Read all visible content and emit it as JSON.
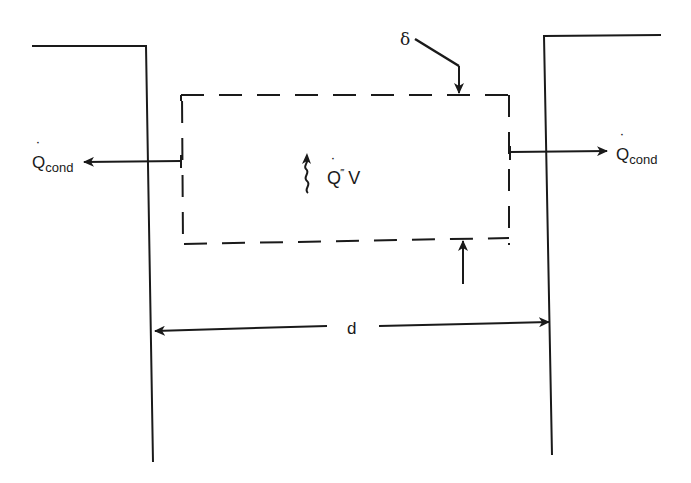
{
  "diagram": {
    "type": "control-volume heat-conduction sketch",
    "colors": {
      "ink": "#1a1a1a",
      "background": "#ffffff"
    },
    "labels": {
      "q_cond_left": {
        "main": "Q",
        "sub": "cond",
        "dot": "˙"
      },
      "q_cond_right": {
        "main": "Q",
        "sub": "cond",
        "dot": "˙"
      },
      "generation": {
        "main": "Q",
        "primes": "‴",
        "suffix": "V",
        "dot": "˙"
      },
      "thickness": "δ",
      "width": "d"
    },
    "elements": {
      "left_wall": "step wall (left)",
      "right_wall": "step wall (right)",
      "control_volume": "dashed rectangle",
      "wavy_arrow": "heat generation indicator"
    }
  }
}
